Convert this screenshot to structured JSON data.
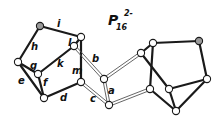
{
  "title": {
    "main": "P",
    "subscript": "16",
    "superscript": "2-"
  },
  "colors": {
    "bond": "#1a1a1a",
    "double_bond": "#555555",
    "node_fill": "#ffffff",
    "shaded_node_fill": "#9a9a9a"
  },
  "nodes": [
    {
      "id": "n1",
      "x": 40,
      "y": 26,
      "shaded": true
    },
    {
      "id": "n2",
      "x": 81,
      "y": 37,
      "shaded": false
    },
    {
      "id": "n3",
      "x": 74,
      "y": 46,
      "shaded": false
    },
    {
      "id": "n4",
      "x": 18,
      "y": 62,
      "shaded": false
    },
    {
      "id": "n5",
      "x": 38,
      "y": 74,
      "shaded": false
    },
    {
      "id": "n6",
      "x": 81,
      "y": 82,
      "shaded": false
    },
    {
      "id": "n7",
      "x": 44,
      "y": 98,
      "shaded": false
    },
    {
      "id": "n8",
      "x": 104,
      "y": 79,
      "shaded": false
    },
    {
      "id": "n9",
      "x": 109,
      "y": 105,
      "shaded": false
    },
    {
      "id": "n10",
      "x": 141,
      "y": 53,
      "shaded": false
    },
    {
      "id": "n11",
      "x": 153,
      "y": 43,
      "shaded": false
    },
    {
      "id": "n12",
      "x": 199,
      "y": 41,
      "shaded": true
    },
    {
      "id": "n13",
      "x": 207,
      "y": 79,
      "shaded": false
    },
    {
      "id": "n14",
      "x": 169,
      "y": 89,
      "shaded": false
    },
    {
      "id": "n15",
      "x": 150,
      "y": 89,
      "shaded": false
    },
    {
      "id": "n16",
      "x": 176,
      "y": 111,
      "shaded": false
    }
  ],
  "bonds": [
    {
      "from": "n1",
      "to": "n2",
      "type": "single",
      "label": "i"
    },
    {
      "from": "n1",
      "to": "n4",
      "type": "single",
      "label": "h"
    },
    {
      "from": "n4",
      "to": "n5",
      "type": "single",
      "label": "g"
    },
    {
      "from": "n4",
      "to": "n7",
      "type": "single",
      "label": "e"
    },
    {
      "from": "n5",
      "to": "n7",
      "type": "single",
      "label": "f"
    },
    {
      "from": "n5",
      "to": "n3",
      "type": "single",
      "label": "k"
    },
    {
      "from": "n3",
      "to": "n2",
      "type": "single",
      "label": "l"
    },
    {
      "from": "n2",
      "to": "n6",
      "type": "single",
      "label": "m"
    },
    {
      "from": "n7",
      "to": "n6",
      "type": "single",
      "label": "d"
    },
    {
      "from": "n3",
      "to": "n8",
      "type": "double",
      "label": "b"
    },
    {
      "from": "n6",
      "to": "n9",
      "type": "double",
      "label": "c"
    },
    {
      "from": "n8",
      "to": "n9",
      "type": "double",
      "label": "a"
    },
    {
      "from": "n8",
      "to": "n10",
      "type": "double",
      "label": ""
    },
    {
      "from": "n9",
      "to": "n15",
      "type": "double",
      "label": ""
    },
    {
      "from": "n10",
      "to": "n11",
      "type": "single",
      "label": ""
    },
    {
      "from": "n11",
      "to": "n12",
      "type": "single",
      "label": ""
    },
    {
      "from": "n12",
      "to": "n13",
      "type": "single",
      "label": ""
    },
    {
      "from": "n13",
      "to": "n14",
      "type": "single",
      "label": ""
    },
    {
      "from": "n13",
      "to": "n16",
      "type": "single",
      "label": ""
    },
    {
      "from": "n14",
      "to": "n16",
      "type": "single",
      "label": ""
    },
    {
      "from": "n10",
      "to": "n14",
      "type": "single",
      "label": ""
    },
    {
      "from": "n11",
      "to": "n15",
      "type": "single",
      "label": ""
    },
    {
      "from": "n15",
      "to": "n16",
      "type": "single",
      "label": ""
    }
  ],
  "labels": [
    {
      "text": "i",
      "x": 57,
      "y": 27
    },
    {
      "text": "h",
      "x": 31,
      "y": 50
    },
    {
      "text": "l",
      "x": 68,
      "y": 46
    },
    {
      "text": "g",
      "x": 30,
      "y": 69
    },
    {
      "text": "k",
      "x": 57,
      "y": 67
    },
    {
      "text": "m",
      "x": 72,
      "y": 74
    },
    {
      "text": "b",
      "x": 92,
      "y": 62
    },
    {
      "text": "e",
      "x": 18,
      "y": 84
    },
    {
      "text": "f",
      "x": 43,
      "y": 86
    },
    {
      "text": "d",
      "x": 60,
      "y": 101
    },
    {
      "text": "a",
      "x": 108,
      "y": 94
    },
    {
      "text": "c",
      "x": 90,
      "y": 102
    }
  ]
}
